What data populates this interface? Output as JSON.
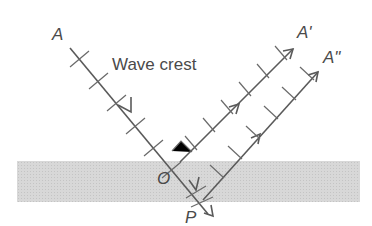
{
  "diagram": {
    "labels": {
      "source": "A",
      "reflected_1": "A'",
      "reflected_2": "A\"",
      "incidence_point": "O",
      "refracted_point": "P",
      "caption": "Wave crest"
    },
    "colors": {
      "band": "#d4d4d4",
      "line": "#5a5a5a",
      "text": "#4a4a4a"
    }
  }
}
